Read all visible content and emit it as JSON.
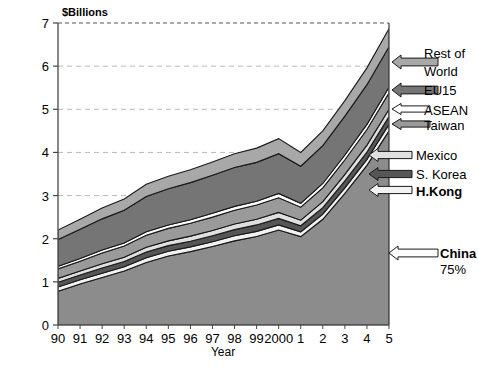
{
  "chart": {
    "yaxis_title": "$Billions",
    "xaxis_title": "Year",
    "y_ticks": [
      "0",
      "1",
      "2",
      "3",
      "4",
      "5",
      "6",
      "7"
    ],
    "x_ticks": [
      "90",
      "91",
      "92",
      "93",
      "94",
      "95",
      "96",
      "97",
      "98",
      "99",
      "2000",
      "1",
      "2",
      "3",
      "4",
      "5"
    ]
  },
  "callouts": [
    {
      "label_line1": "Rest of",
      "label_line2": "World",
      "bold": false
    },
    {
      "label_line1": "EU15",
      "label_line2": "",
      "bold": false
    },
    {
      "label_line1": "ASEAN",
      "label_line2": "",
      "bold": false
    },
    {
      "label_line1": "Taiwan",
      "label_line2": "",
      "bold": false
    },
    {
      "label_line1": "Mexico",
      "label_line2": "",
      "bold": false
    },
    {
      "label_line1": "S. Korea",
      "label_line2": "",
      "bold": false
    },
    {
      "label_line1": "H.Kong",
      "label_line2": "",
      "bold": true
    },
    {
      "label_line1": "China",
      "label_line2": "75%",
      "bold": true
    }
  ],
  "chart_data": {
    "type": "area",
    "title": "",
    "subtitle": "",
    "xlabel": "Year",
    "ylabel": "$Billions",
    "ylim": [
      0,
      7
    ],
    "grid": true,
    "legend_position": "right-callouts",
    "stacked": true,
    "annotations": [
      "China 75%"
    ],
    "x": [
      "90",
      "91",
      "92",
      "93",
      "94",
      "95",
      "96",
      "97",
      "98",
      "99",
      "2000",
      "1",
      "2",
      "3",
      "4",
      "5"
    ],
    "series": [
      {
        "name": "China",
        "color": "#8c8c8c",
        "values": [
          0.78,
          0.95,
          1.1,
          1.25,
          1.45,
          1.6,
          1.7,
          1.82,
          1.95,
          2.05,
          2.2,
          2.05,
          2.45,
          3.05,
          3.7,
          4.5
        ]
      },
      {
        "name": "H.Kong",
        "color": "#f2f2f2",
        "values": [
          0.1,
          0.1,
          0.1,
          0.1,
          0.11,
          0.11,
          0.11,
          0.11,
          0.12,
          0.12,
          0.12,
          0.11,
          0.12,
          0.13,
          0.14,
          0.15
        ]
      },
      {
        "name": "S. Korea",
        "color": "#565656",
        "values": [
          0.11,
          0.11,
          0.12,
          0.12,
          0.13,
          0.13,
          0.13,
          0.14,
          0.14,
          0.15,
          0.15,
          0.14,
          0.15,
          0.16,
          0.17,
          0.18
        ]
      },
      {
        "name": "Mexico",
        "color": "#e0e0e0",
        "values": [
          0.09,
          0.09,
          0.1,
          0.1,
          0.11,
          0.11,
          0.12,
          0.12,
          0.13,
          0.13,
          0.14,
          0.13,
          0.14,
          0.15,
          0.16,
          0.17
        ]
      },
      {
        "name": "Taiwan",
        "color": "#9a9a9a",
        "values": [
          0.22,
          0.23,
          0.25,
          0.26,
          0.28,
          0.29,
          0.3,
          0.31,
          0.32,
          0.33,
          0.34,
          0.3,
          0.32,
          0.34,
          0.36,
          0.38
        ]
      },
      {
        "name": "ASEAN",
        "color": "#ffffff",
        "values": [
          0.06,
          0.06,
          0.07,
          0.07,
          0.08,
          0.08,
          0.08,
          0.09,
          0.09,
          0.09,
          0.1,
          0.09,
          0.1,
          0.11,
          0.12,
          0.13
        ]
      },
      {
        "name": "EU15",
        "color": "#757575",
        "values": [
          0.62,
          0.68,
          0.72,
          0.76,
          0.82,
          0.84,
          0.86,
          0.88,
          0.9,
          0.9,
          0.92,
          0.86,
          0.88,
          0.9,
          0.92,
          0.94
        ]
      },
      {
        "name": "Rest of World",
        "color": "#a8a8a8",
        "values": [
          0.22,
          0.23,
          0.25,
          0.26,
          0.28,
          0.29,
          0.3,
          0.31,
          0.32,
          0.33,
          0.35,
          0.32,
          0.34,
          0.36,
          0.39,
          0.42
        ]
      }
    ],
    "totals": [
      2.2,
      2.45,
      2.71,
      2.92,
      3.26,
      3.45,
      3.6,
      3.78,
      3.97,
      4.1,
      4.32,
      4.0,
      4.5,
      5.3,
      5.96,
      6.87
    ]
  }
}
